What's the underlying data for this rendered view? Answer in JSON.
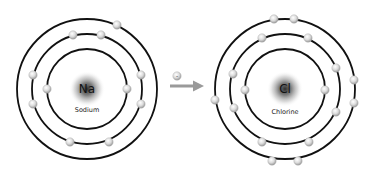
{
  "diagram": {
    "type": "bohr-model-ionic-bond",
    "colors": {
      "orbit": "#111111",
      "electron": "#d9d9d9",
      "arrow": "#9a9a9a",
      "background": "#ffffff"
    },
    "transfer": {
      "electron_label": "-",
      "direction": "sodium-to-chlorine"
    },
    "atoms": [
      {
        "id": "sodium",
        "symbol": "Na",
        "name": "Sodium",
        "center": [
          87,
          89
        ],
        "shells": [
          {
            "radius": 40,
            "electrons": [
              [
                47,
                89
              ],
              [
                127,
                89
              ]
            ]
          },
          {
            "radius": 55,
            "electrons": [
              [
                73,
                35
              ],
              [
                101,
                35
              ],
              [
                33,
                75
              ],
              [
                33,
                104
              ],
              [
                141,
                75
              ],
              [
                141,
                104
              ],
              [
                70,
                142
              ],
              [
                109,
                142
              ]
            ]
          },
          {
            "radius": 70,
            "electrons": [
              [
                117,
                25
              ]
            ]
          }
        ],
        "electron_count": 11
      },
      {
        "id": "chlorine",
        "symbol": "Cl",
        "name": "Chlorine",
        "center": [
          285,
          89
        ],
        "shells": [
          {
            "radius": 40,
            "electrons": [
              [
                245,
                90
              ],
              [
                325,
                90
              ]
            ]
          },
          {
            "radius": 55,
            "electrons": [
              [
                262,
                38
              ],
              [
                308,
                38
              ],
              [
                233,
                74
              ],
              [
                234,
                108
              ],
              [
                336,
                68
              ],
              [
                336,
                112
              ],
              [
                262,
                142
              ],
              [
                309,
                142
              ]
            ]
          },
          {
            "radius": 70,
            "electrons": [
              [
                274,
                19
              ],
              [
                294,
                19
              ],
              [
                215,
                100
              ],
              [
                354,
                80
              ],
              [
                354,
                103
              ],
              [
                272,
                161
              ],
              [
                298,
                161
              ]
            ]
          }
        ],
        "electron_count": 17
      }
    ]
  }
}
